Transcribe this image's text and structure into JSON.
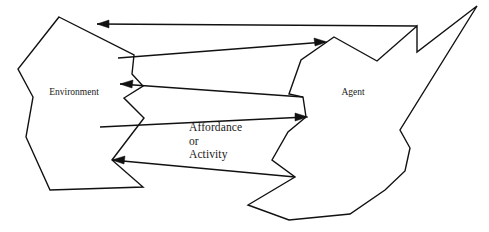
{
  "diagram": {
    "type": "conceptual-flow-diagram",
    "background_color": "#ffffff",
    "stroke_color": "#111111",
    "width": 489,
    "height": 232,
    "nodes": [
      {
        "id": "environment",
        "label": "Environment",
        "label_x": 74,
        "label_y": 93,
        "shape": "irregular-polygon",
        "points": "59,17 134,55 132,74 143,86 124,98 144,118 112,160 143,187 50,190 26,137 33,97 18,69"
      },
      {
        "id": "agent",
        "label": "Agent",
        "label_x": 353,
        "label_y": 93,
        "shape": "irregular-polygon-with-spike",
        "points": "334,37 377,61 417,26 417,52 477,6 400,130 410,148 405,171 385,190 350,214 289,220 248,205 295,177 272,160 288,132 306,117 303,97 289,94 301,60"
      }
    ],
    "flows": [
      {
        "id": "flow-1-agent-to-environment-top",
        "direction": "right-to-left",
        "from": "agent",
        "to": "environment",
        "line": "417,26 97,24",
        "head_points": "97,24 109,20 109,28",
        "label": ""
      },
      {
        "id": "flow-2-environment-to-agent-upper",
        "direction": "left-to-right",
        "from": "environment",
        "to": "agent",
        "line": "118,58 325,42",
        "head_points": "327,42 314,38 315,46",
        "label": ""
      },
      {
        "id": "flow-3-agent-to-environment-upper-mid",
        "direction": "right-to-left",
        "from": "agent",
        "to": "environment",
        "line": "303,97 120,84",
        "head_points": "120,84 133,80 132,88",
        "label": ""
      },
      {
        "id": "flow-4-environment-to-agent-lower-mid",
        "direction": "left-to-right",
        "from": "environment",
        "to": "agent",
        "line": "100,127 306,117",
        "head_points": "308,117 295,113 295,121",
        "label": "Affordance or Activity"
      },
      {
        "id": "flow-5-agent-to-environment-bottom",
        "direction": "right-to-left",
        "from": "agent",
        "to": "environment",
        "line": "295,177 112,160",
        "head_points": "112,160 125,156 124,164",
        "label": ""
      }
    ],
    "center_caption": {
      "lines": [
        "Affordance",
        "or",
        "Activity"
      ],
      "text": "Affordance\nor\nActivity",
      "x": 189,
      "y": 121
    }
  }
}
